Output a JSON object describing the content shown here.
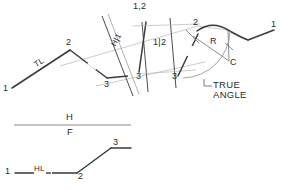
{
  "drawing": {
    "title_visible": false,
    "ink_color": "#3a3a3a",
    "light_ink_color": "#a9a9a9",
    "background": "#ffffff",
    "top_view": {
      "name": "auxiliary-rotation-construction",
      "point_labels": {
        "p1_left": "1",
        "p2_apex": "2",
        "p3_right": "3"
      },
      "true_length_label": "TL",
      "fold_line_h1": "H|1",
      "fold_line_12_top": "1,2",
      "fold_line_12_right": "1|2",
      "point_3_center": "3",
      "point_3_right": "3",
      "rotation": {
        "point_2": "2",
        "radius_label": "R",
        "center_label": "C",
        "point_1_end": "1",
        "arc_visible": true
      },
      "annotation": {
        "line1": "TRUE",
        "line2": "ANGLE"
      }
    },
    "bottom_view": {
      "name": "h-f-fold-line-view",
      "fold_line": {
        "upper_label": "H",
        "lower_label": "F"
      },
      "point_labels": {
        "p1": "1",
        "p2": "2",
        "p3": "3"
      },
      "horizontal_line_label": "HL"
    }
  }
}
